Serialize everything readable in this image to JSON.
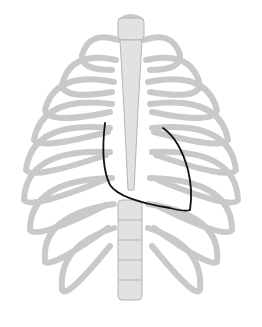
{
  "figure": {
    "overlay": "heart-outline",
    "colors": {
      "background": "#ffffff",
      "bone": "#e6e6e6",
      "bone_stroke": "#b9b9b9",
      "outline": "#111111"
    }
  }
}
